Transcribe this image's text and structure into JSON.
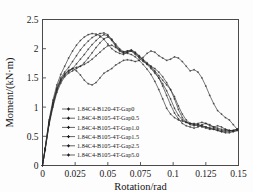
{
  "figure": {
    "background": "#fdfdfd",
    "foreground": "#1a1a1a"
  },
  "chart_data": {
    "type": "line",
    "title": "",
    "xlabel": "Rotation/rad",
    "ylabel": "Moment/(kN·m)",
    "xlim": [
      0,
      0.15
    ],
    "ylim": [
      0,
      2.5
    ],
    "xticks": [
      0,
      0.025,
      0.05,
      0.075,
      0.1,
      0.125,
      0.15
    ],
    "xticklabels": [
      "0",
      "0.025",
      "0.05",
      "0.075",
      "0.1",
      "0.125",
      "0.15"
    ],
    "yticks": [
      0,
      0.5,
      1,
      1.5,
      2,
      2.5
    ],
    "yticklabels": [
      "0",
      "0.5",
      "1",
      "1.5",
      "2",
      "2.5"
    ],
    "grid": false,
    "legend_position": "center-left-inside",
    "marker": "plus-line",
    "series": [
      {
        "name": "1.84C4-B120-4T-Gap0",
        "color": "#2b2b2b",
        "x": [
          0,
          0.002,
          0.005,
          0.008,
          0.011,
          0.014,
          0.017,
          0.02,
          0.023,
          0.026,
          0.029,
          0.032,
          0.035,
          0.038,
          0.041,
          0.044,
          0.047,
          0.05,
          0.053,
          0.056,
          0.059,
          0.062,
          0.065,
          0.068,
          0.071,
          0.074,
          0.077,
          0.08,
          0.083,
          0.086,
          0.089,
          0.092,
          0.095,
          0.098,
          0.101,
          0.104,
          0.107,
          0.11,
          0.113,
          0.116,
          0.119,
          0.122,
          0.125,
          0.128,
          0.131,
          0.134,
          0.137,
          0.14,
          0.143,
          0.146,
          0.149
        ],
        "y": [
          0.0,
          0.28,
          0.72,
          1.05,
          1.3,
          1.46,
          1.56,
          1.62,
          1.66,
          1.62,
          1.55,
          1.46,
          1.4,
          1.38,
          1.42,
          1.5,
          1.58,
          1.62,
          1.66,
          1.72,
          1.76,
          1.8,
          1.81,
          1.8,
          1.78,
          1.8,
          1.85,
          1.92,
          1.96,
          1.94,
          1.88,
          1.84,
          1.8,
          1.82,
          1.86,
          1.84,
          1.78,
          1.7,
          1.62,
          1.64,
          1.6,
          1.5,
          1.36,
          1.2,
          1.06,
          0.94,
          0.88,
          0.82,
          0.78,
          0.7,
          0.62
        ]
      },
      {
        "name": "1.84C4-B105-4T-Gap0.5",
        "color": "#2b2b2b",
        "x": [
          0,
          0.002,
          0.005,
          0.008,
          0.011,
          0.014,
          0.017,
          0.02,
          0.023,
          0.026,
          0.029,
          0.032,
          0.035,
          0.038,
          0.041,
          0.044,
          0.047,
          0.05,
          0.053,
          0.056,
          0.059,
          0.062,
          0.065,
          0.068,
          0.071,
          0.074,
          0.077,
          0.08,
          0.083,
          0.086,
          0.089,
          0.092,
          0.095,
          0.098,
          0.101,
          0.104,
          0.107,
          0.11,
          0.113,
          0.116,
          0.119,
          0.122,
          0.125,
          0.128,
          0.131,
          0.134,
          0.137,
          0.14,
          0.143,
          0.146,
          0.149
        ],
        "y": [
          0.0,
          0.3,
          0.78,
          1.12,
          1.38,
          1.56,
          1.7,
          1.84,
          1.96,
          2.06,
          2.14,
          2.2,
          2.24,
          2.26,
          2.25,
          2.22,
          2.16,
          2.08,
          2.0,
          1.95,
          1.92,
          1.9,
          1.94,
          1.96,
          1.92,
          1.86,
          1.8,
          1.74,
          1.68,
          1.6,
          1.5,
          1.36,
          1.2,
          1.04,
          0.9,
          0.8,
          0.72,
          0.68,
          0.66,
          0.64,
          0.66,
          0.7,
          0.72,
          0.7,
          0.66,
          0.64,
          0.62,
          0.62,
          0.6,
          0.58,
          0.6
        ]
      },
      {
        "name": "1.84C4-B105-4T-Gap1.0",
        "color": "#2b2b2b",
        "x": [
          0,
          0.002,
          0.005,
          0.008,
          0.011,
          0.014,
          0.017,
          0.02,
          0.023,
          0.026,
          0.029,
          0.032,
          0.035,
          0.038,
          0.041,
          0.044,
          0.047,
          0.05,
          0.053,
          0.056,
          0.059,
          0.062,
          0.065,
          0.068,
          0.071,
          0.074,
          0.077,
          0.08,
          0.083,
          0.086,
          0.089,
          0.092,
          0.095,
          0.098,
          0.101,
          0.104,
          0.107,
          0.11,
          0.113,
          0.116,
          0.119,
          0.122,
          0.125,
          0.128,
          0.131,
          0.134,
          0.137,
          0.14,
          0.143,
          0.146,
          0.149
        ],
        "y": [
          0.0,
          0.29,
          0.75,
          1.08,
          1.33,
          1.5,
          1.6,
          1.68,
          1.78,
          1.88,
          1.98,
          2.06,
          2.13,
          2.19,
          2.23,
          2.26,
          2.27,
          2.24,
          2.16,
          2.06,
          1.98,
          1.94,
          1.96,
          1.98,
          1.94,
          1.88,
          1.82,
          1.76,
          1.7,
          1.62,
          1.54,
          1.46,
          1.38,
          1.3,
          1.18,
          1.02,
          0.88,
          0.78,
          0.72,
          0.7,
          0.72,
          0.74,
          0.72,
          0.68,
          0.66,
          0.68,
          0.66,
          0.62,
          0.6,
          0.6,
          0.62
        ]
      },
      {
        "name": "1.84C4-B105-4T-Gap1.5",
        "color": "#2b2b2b",
        "x": [
          0,
          0.002,
          0.005,
          0.008,
          0.011,
          0.014,
          0.017,
          0.02,
          0.023,
          0.026,
          0.029,
          0.032,
          0.035,
          0.038,
          0.041,
          0.044,
          0.047,
          0.05,
          0.053,
          0.056,
          0.059,
          0.062,
          0.065,
          0.068,
          0.071,
          0.074,
          0.077,
          0.08,
          0.083,
          0.086,
          0.089,
          0.092,
          0.095,
          0.098,
          0.101,
          0.104,
          0.107,
          0.11,
          0.113,
          0.116,
          0.119,
          0.122,
          0.125,
          0.128,
          0.131,
          0.134,
          0.137,
          0.14,
          0.143,
          0.146,
          0.149
        ],
        "y": [
          0.0,
          0.27,
          0.71,
          1.03,
          1.28,
          1.44,
          1.54,
          1.6,
          1.66,
          1.74,
          1.82,
          1.9,
          1.99,
          2.07,
          2.14,
          2.2,
          2.24,
          2.22,
          2.14,
          2.04,
          1.96,
          1.92,
          1.94,
          1.96,
          1.9,
          1.84,
          1.78,
          1.74,
          1.7,
          1.66,
          1.6,
          1.52,
          1.42,
          1.3,
          1.14,
          0.96,
          0.82,
          0.74,
          0.7,
          0.68,
          0.7,
          0.68,
          0.66,
          0.64,
          0.62,
          0.6,
          0.58,
          0.56,
          0.56,
          0.58,
          0.6
        ]
      },
      {
        "name": "1.84C4-B105-4T-Gap2.5",
        "color": "#2b2b2b",
        "x": [
          0,
          0.002,
          0.005,
          0.008,
          0.011,
          0.014,
          0.017,
          0.02,
          0.023,
          0.026,
          0.029,
          0.032,
          0.035,
          0.038,
          0.041,
          0.044,
          0.047,
          0.05,
          0.053,
          0.056,
          0.059,
          0.062,
          0.065,
          0.068,
          0.071,
          0.074,
          0.077,
          0.08,
          0.083,
          0.086,
          0.089,
          0.092,
          0.095,
          0.098,
          0.101,
          0.104,
          0.107,
          0.11,
          0.113,
          0.116,
          0.119,
          0.122,
          0.125,
          0.128,
          0.131,
          0.134,
          0.137,
          0.14,
          0.143,
          0.146,
          0.149
        ],
        "y": [
          0.0,
          0.26,
          0.69,
          1.0,
          1.25,
          1.41,
          1.52,
          1.58,
          1.62,
          1.66,
          1.7,
          1.76,
          1.84,
          1.93,
          2.02,
          2.1,
          2.17,
          2.2,
          2.16,
          2.08,
          2.0,
          1.95,
          1.96,
          1.97,
          1.93,
          1.87,
          1.8,
          1.73,
          1.66,
          1.58,
          1.5,
          1.4,
          1.28,
          1.14,
          0.98,
          0.86,
          0.78,
          0.74,
          0.72,
          0.7,
          0.68,
          0.66,
          0.64,
          0.62,
          0.62,
          0.6,
          0.58,
          0.58,
          0.58,
          0.6,
          0.62
        ]
      },
      {
        "name": "1.84C4-B105-4T-Gap5.0",
        "color": "#2b2b2b",
        "x": [
          0,
          0.002,
          0.005,
          0.008,
          0.011,
          0.014,
          0.017,
          0.02,
          0.023,
          0.026,
          0.029,
          0.032,
          0.035,
          0.038,
          0.041,
          0.044,
          0.047,
          0.05,
          0.053,
          0.056,
          0.059,
          0.062,
          0.065,
          0.068,
          0.071,
          0.074,
          0.077,
          0.08,
          0.083,
          0.086,
          0.089,
          0.092,
          0.095,
          0.098,
          0.101,
          0.104,
          0.107,
          0.11,
          0.113,
          0.116,
          0.119,
          0.122,
          0.125,
          0.128,
          0.131,
          0.134,
          0.137,
          0.14,
          0.143,
          0.146,
          0.149
        ],
        "y": [
          0.0,
          0.28,
          0.73,
          1.06,
          1.31,
          1.47,
          1.57,
          1.63,
          1.66,
          1.68,
          1.7,
          1.73,
          1.77,
          1.82,
          1.88,
          1.94,
          2.0,
          2.05,
          2.06,
          2.02,
          1.97,
          1.93,
          1.92,
          1.9,
          1.86,
          1.8,
          1.73,
          1.65,
          1.56,
          1.44,
          1.3,
          1.14,
          0.98,
          0.88,
          0.82,
          0.78,
          0.76,
          0.74,
          0.72,
          0.72,
          0.7,
          0.68,
          0.66,
          0.64,
          0.64,
          0.62,
          0.6,
          0.6,
          0.6,
          0.6,
          0.62
        ]
      }
    ]
  },
  "legend": {
    "entries": [
      {
        "label": "1.84C4-B120-4T-Gap0"
      },
      {
        "label": "1.84C4-B105-4T-Gap0.5"
      },
      {
        "label": "1.84C4-B105-4T-Gap1.0"
      },
      {
        "label": "1.84C4-B105-4T-Gap1.5"
      },
      {
        "label": "1.84C4-B105-4T-Gap2.5"
      },
      {
        "label": "1.84C4-B105-4T-Gap5.0"
      }
    ]
  }
}
